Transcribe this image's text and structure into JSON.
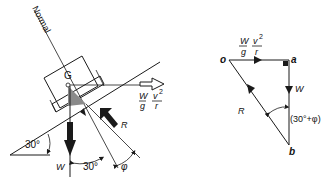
{
  "left_diagram": {
    "normal_label": "Normal",
    "centre_label": "G",
    "centrifugal_num": "W",
    "centrifugal_den": "g",
    "centrifugal_v": "v",
    "centrifugal_exp": "2",
    "centrifugal_r": "r",
    "weight_label": "W",
    "reaction_label": "R",
    "incline_angle": "30°",
    "normal_angle": "30°",
    "friction_angle": "φ"
  },
  "right_diagram": {
    "point_o": "o",
    "point_a": "a",
    "point_b": "b",
    "force_num": "W",
    "force_den": "g",
    "force_v": "v",
    "force_exp": "2",
    "force_r": "r",
    "weight_label": "W",
    "reaction_label": "R",
    "angle_label": "(30°+φ)"
  }
}
